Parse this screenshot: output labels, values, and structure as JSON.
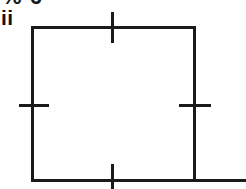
{
  "figure": {
    "type": "geometry-diagram",
    "label": "ii",
    "clipped_text_above": "% 6",
    "background_color": "#ffffff",
    "stroke_color": "#1a1a1a",
    "canvas": {
      "width": 246,
      "height": 189
    },
    "square": {
      "name": "square",
      "x": 32,
      "y": 27,
      "width": 162,
      "height": 153,
      "stroke_width": 3
    },
    "baseline_extension": {
      "name": "baseline-extension",
      "x1": 194,
      "x2": 246,
      "y": 180,
      "stroke_width": 3
    },
    "tick_marks": [
      {
        "side": "top",
        "orientation": "vertical",
        "x1": 112,
        "y1": 12,
        "x2": 112,
        "y2": 43,
        "stroke_width": 3
      },
      {
        "side": "left",
        "orientation": "horizontal",
        "x1": 19,
        "y1": 105,
        "x2": 49,
        "y2": 105,
        "stroke_width": 3
      },
      {
        "side": "right",
        "orientation": "horizontal",
        "x1": 179,
        "y1": 105,
        "x2": 211,
        "y2": 105,
        "stroke_width": 3
      },
      {
        "side": "bottom",
        "orientation": "vertical",
        "x1": 112,
        "y1": 164,
        "x2": 112,
        "y2": 189,
        "stroke_width": 3
      }
    ]
  }
}
